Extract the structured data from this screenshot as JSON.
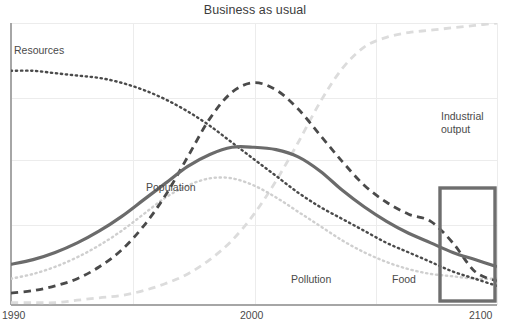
{
  "chart_data": {
    "type": "line",
    "title": "Business as usual",
    "xlabel": "",
    "ylabel": "",
    "xlim": [
      1990,
      2100
    ],
    "ylim": [
      0,
      100
    ],
    "grid": true,
    "legend_position": "inline-annotations",
    "xticks": [
      "1990",
      "2000",
      "2100"
    ],
    "xtick_values": [
      1990,
      2000,
      2100
    ],
    "yticks": [],
    "annotations": [
      {
        "name": "highlight-box",
        "kind": "rectangle",
        "x_range": [
          2089,
          2101
        ],
        "y_range": [
          2,
          28
        ],
        "color": "#6e6e6e"
      }
    ],
    "series": [
      {
        "name": "Resources",
        "label": "Resources",
        "style": "dotted",
        "color": "#4a4a4a",
        "width": 2.4,
        "x": [
          1990,
          1995,
          2000,
          2005,
          2010,
          2015,
          2020,
          2025,
          2030,
          2035,
          2040,
          2045,
          2050,
          2055,
          2060,
          2065,
          2070,
          2075,
          2080,
          2085,
          2090,
          2095,
          2100
        ],
        "values": [
          98,
          98,
          97,
          96,
          95,
          93,
          90,
          86,
          81,
          75,
          68,
          61,
          54,
          47,
          41,
          36,
          31,
          26,
          22,
          18,
          14,
          11,
          8
        ]
      },
      {
        "name": "Population",
        "label": "Population",
        "style": "solid",
        "color": "#6b6b6b",
        "width": 3.2,
        "x": [
          1990,
          1995,
          2000,
          2005,
          2010,
          2015,
          2020,
          2025,
          2030,
          2035,
          2040,
          2045,
          2050,
          2055,
          2060,
          2065,
          2070,
          2075,
          2080,
          2085,
          2090,
          2095,
          2100
        ],
        "values": [
          17,
          19,
          22,
          26,
          31,
          37,
          44,
          51,
          58,
          63,
          66,
          66,
          65,
          62,
          56,
          48,
          41,
          35,
          30,
          26,
          22,
          19,
          16
        ]
      },
      {
        "name": "Industrial output",
        "label": "Industrial output",
        "style": "dashed",
        "color": "#4a4a4a",
        "width": 2.8,
        "x": [
          1990,
          1995,
          2000,
          2005,
          2010,
          2015,
          2020,
          2025,
          2030,
          2035,
          2040,
          2045,
          2050,
          2055,
          2060,
          2065,
          2070,
          2075,
          2080,
          2085,
          2090,
          2095,
          2100
        ],
        "values": [
          5,
          6,
          8,
          11,
          16,
          23,
          33,
          46,
          62,
          78,
          89,
          93,
          90,
          82,
          71,
          60,
          50,
          43,
          38,
          35,
          26,
          14,
          10
        ]
      },
      {
        "name": "Food",
        "label": "Food",
        "style": "dotted",
        "color": "#cfcfcf",
        "width": 2.4,
        "x": [
          1990,
          1995,
          2000,
          2005,
          2010,
          2015,
          2020,
          2025,
          2030,
          2035,
          2040,
          2045,
          2050,
          2055,
          2060,
          2065,
          2070,
          2075,
          2080,
          2085,
          2090,
          2095,
          2100
        ],
        "values": [
          11,
          13,
          16,
          20,
          25,
          31,
          38,
          45,
          50,
          53,
          53,
          50,
          45,
          39,
          33,
          27,
          22,
          18,
          15,
          13,
          12,
          11,
          11
        ]
      },
      {
        "name": "Pollution",
        "label": "Pollution",
        "style": "dashed",
        "color": "#dcdcdc",
        "width": 2.8,
        "x": [
          1990,
          1995,
          2000,
          2005,
          2010,
          2015,
          2020,
          2025,
          2030,
          2035,
          2040,
          2045,
          2050,
          2055,
          2060,
          2065,
          2070,
          2075,
          2080,
          2085,
          2090,
          2095,
          2100
        ],
        "values": [
          1,
          1,
          1,
          2,
          3,
          4,
          6,
          9,
          13,
          19,
          27,
          38,
          52,
          68,
          85,
          99,
          108,
          112,
          114,
          115,
          116,
          117,
          118
        ]
      }
    ]
  },
  "chart": {
    "title": "Business as usual",
    "xticks": {
      "left": "1990",
      "middle": "2000",
      "right": "2100"
    },
    "labels": {
      "resources": "Resources",
      "population": "Population",
      "industrial_output": "Industrial output",
      "pollution": "Pollution",
      "food": "Food"
    },
    "colors": {
      "axis": "#9a9a9a",
      "grid": "#ebebeb",
      "text": "#4a4a4a",
      "resources": "#4a4a4a",
      "population": "#6b6b6b",
      "industrial_output": "#4a4a4a",
      "food": "#cfcfcf",
      "pollution": "#dcdcdc",
      "highlight_box": "#6e6e6e"
    }
  }
}
